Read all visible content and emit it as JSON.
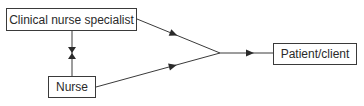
{
  "diagram": {
    "type": "flow",
    "nodes": [
      {
        "id": "cns",
        "label": "Clinical nurse specialist"
      },
      {
        "id": "nurse",
        "label": "Nurse"
      },
      {
        "id": "patient",
        "label": "Patient/client"
      }
    ],
    "edges": [
      {
        "from": "cns",
        "to": "nurse",
        "bidirectional": true
      },
      {
        "from": "cns",
        "to": "patient",
        "via": "merge-point"
      },
      {
        "from": "nurse",
        "to": "patient",
        "via": "merge-point"
      }
    ],
    "colors": {
      "line": "#3a3a3a",
      "background": "#ffffff"
    }
  }
}
